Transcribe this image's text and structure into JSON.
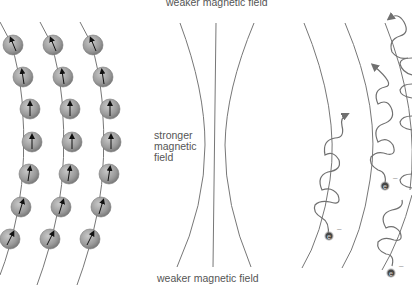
{
  "panels": {
    "spins": {
      "description": "Three chains of spinning particles with spin arrows aligned along field lines",
      "columns": 3,
      "particles_per_column": 7,
      "particle_color": "#9a9a9a",
      "arrow_color": "#111111",
      "line_color": "#777777"
    },
    "field_lines": {
      "top_label": "weaker magnetic field",
      "middle_label": "stronger magnetic field",
      "middle_label_lines": [
        "stronger",
        "magnetic",
        "field"
      ],
      "bottom_label": "weaker magnetic field",
      "line_count": 3,
      "line_color": "#777777"
    },
    "electron_spirals": {
      "description": "Electrons spiraling around curved magnetic field lines",
      "electron_symbol": "e",
      "charge_symbol": "–",
      "electron_count": 4,
      "spiral_color": "#707070"
    }
  }
}
